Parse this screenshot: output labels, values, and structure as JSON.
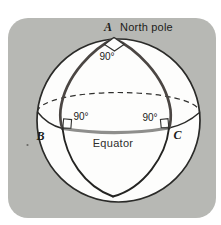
{
  "figure": {
    "labels": {
      "vertex_a": "A",
      "north_pole": "North pole",
      "angle_a": "90°",
      "angle_b": "90°",
      "angle_c": "90°",
      "vertex_b": "B",
      "vertex_c": "C",
      "equator": "Equator"
    },
    "colors": {
      "panel_bg": "#b7b8b4",
      "sphere_fill": "#fdfdfc",
      "outline": "#2a2a28",
      "equator_back": "#2f2f2d",
      "triangle_meridian": "#4b4643",
      "triangle_equator": "#8e8e8c",
      "marker_stroke": "#333331",
      "speck": "#6a6a66"
    }
  }
}
